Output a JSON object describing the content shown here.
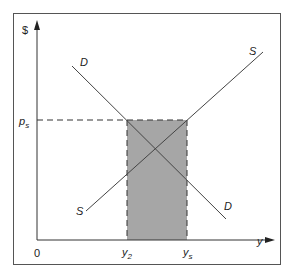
{
  "diagram": {
    "axes": {
      "y_label": "$",
      "x_label": "y",
      "origin_label": "0"
    },
    "curves": {
      "demand_label_top": "D",
      "demand_label_bottom": "D",
      "supply_label_top": "S",
      "supply_label_bottom": "S"
    },
    "markers": {
      "price_label": "p",
      "price_sub": "s",
      "q2_label": "y",
      "q2_sub": "2",
      "qs_label": "y",
      "qs_sub": "s"
    },
    "colors": {
      "frame": "#555555",
      "lines": "#444444",
      "shade": "#a6a6a6"
    }
  }
}
